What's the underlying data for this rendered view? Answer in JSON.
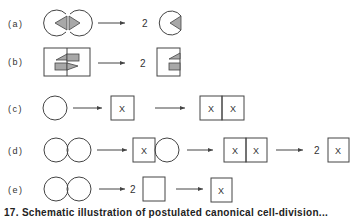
{
  "figure": {
    "rows": [
      {
        "id": "a",
        "label": "(a)",
        "multipliers": [
          "2"
        ]
      },
      {
        "id": "b",
        "label": "(b)",
        "multipliers": [
          "2"
        ]
      },
      {
        "id": "c",
        "label": "(c)",
        "marks": [
          "X",
          "X",
          "X"
        ]
      },
      {
        "id": "d",
        "label": "(d)",
        "marks": [
          "X",
          "X",
          "X",
          "X"
        ],
        "multipliers": [
          "2"
        ]
      },
      {
        "id": "e",
        "label": "(e)",
        "marks": [
          "X"
        ],
        "multipliers": [
          "2"
        ]
      }
    ],
    "caption": "17. Schematic illustration of postulated canonical cell-division..."
  },
  "colors": {
    "line": "#444444",
    "fill_gray": "#a8a8a8",
    "background": "#ffffff"
  }
}
